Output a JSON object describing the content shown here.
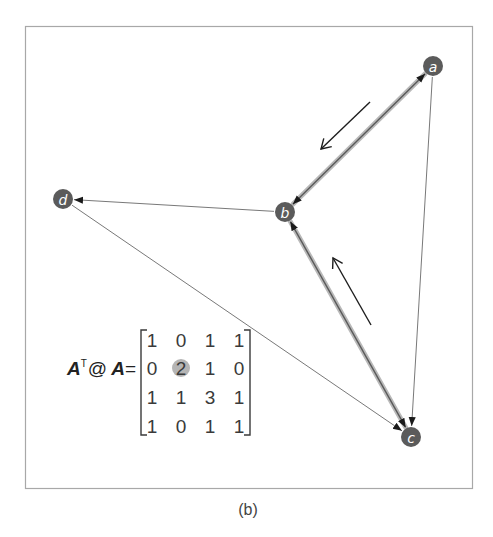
{
  "figure": {
    "caption": "(b)",
    "frame": {
      "x": 25,
      "y": 26,
      "width": 447,
      "height": 462
    }
  },
  "colors": {
    "node_fill": "#5b5b5b",
    "node_text": "#ffffff",
    "highlight_edge": "#b9b9b9",
    "edge": "#555555",
    "indicator_arrow": "#1e1e1e",
    "matrix_highlight": "#b5b5b5"
  },
  "graph": {
    "nodes": [
      {
        "id": "a",
        "label": "a",
        "x": 433,
        "y": 66
      },
      {
        "id": "b",
        "label": "b",
        "x": 285,
        "y": 212
      },
      {
        "id": "c",
        "label": "c",
        "x": 411,
        "y": 437
      },
      {
        "id": "d",
        "label": "d",
        "x": 63,
        "y": 199
      }
    ],
    "edges": [
      {
        "from": "a",
        "to": "b",
        "bidirectional": true,
        "highlighted": true
      },
      {
        "from": "b",
        "to": "c",
        "bidirectional": true,
        "highlighted": true
      },
      {
        "from": "a",
        "to": "c",
        "bidirectional": false,
        "highlighted": false
      },
      {
        "from": "b",
        "to": "d",
        "bidirectional": false,
        "highlighted": false
      },
      {
        "from": "d",
        "to": "c",
        "bidirectional": false,
        "highlighted": false
      }
    ],
    "walk_indicators": [
      {
        "description": "a to b",
        "x1": 370,
        "y1": 102,
        "x2": 321,
        "y2": 149
      },
      {
        "description": "c to b",
        "x1": 371,
        "y1": 325,
        "x2": 333,
        "y2": 258
      }
    ]
  },
  "formula": {
    "lhs_matrix": "A",
    "transpose_sup": "T",
    "operator": "@",
    "rhs_matrix": "A",
    "equals": "="
  },
  "matrix": {
    "rows": [
      [
        "1",
        "0",
        "1",
        "1"
      ],
      [
        "0",
        "2",
        "1",
        "0"
      ],
      [
        "1",
        "1",
        "3",
        "1"
      ],
      [
        "1",
        "0",
        "1",
        "1"
      ]
    ],
    "highlighted_cell": {
      "row": 1,
      "col": 1,
      "value": "2"
    }
  }
}
